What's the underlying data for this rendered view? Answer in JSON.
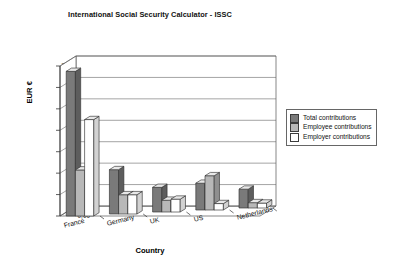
{
  "chart_data": {
    "type": "bar",
    "title": "International Social Security Calculator - ISSC",
    "xlabel": "Country",
    "ylabel": "EUR €",
    "categories": [
      "France",
      "Germany",
      "UK",
      "US",
      "Netherlands"
    ],
    "series": [
      {
        "name": "Total contributions",
        "values": [
          67500,
          20700,
          11500,
          12500,
          8800
        ],
        "color": "#7a7a7a"
      },
      {
        "name": "Employee contributions",
        "values": [
          21500,
          9000,
          5500,
          16000,
          2500
        ],
        "color": "#b8b8b8"
      },
      {
        "name": "Employer contributions",
        "values": [
          45000,
          9000,
          6000,
          3000,
          2300
        ],
        "color": "#ffffff"
      }
    ],
    "ylim": [
      0,
      70000
    ],
    "ytick_values": [
      0,
      10000,
      20000,
      30000,
      40000,
      50000,
      60000,
      70000
    ],
    "ytick_labels": [
      "0,00",
      "10.000,00",
      "20.000,00",
      "30.000,00",
      "40.000,00",
      "50.000,00",
      "60.000,00",
      "70.000,00"
    ],
    "grid": true,
    "legend_position": "right",
    "projection": "3d-bar",
    "number_format": "european"
  },
  "legend": {
    "items": [
      {
        "label": "Total contributions",
        "color": "#7a7a7a"
      },
      {
        "label": "Employee contributions",
        "color": "#b8b8b8"
      },
      {
        "label": "Employer contributions",
        "color": "#ffffff"
      }
    ]
  }
}
